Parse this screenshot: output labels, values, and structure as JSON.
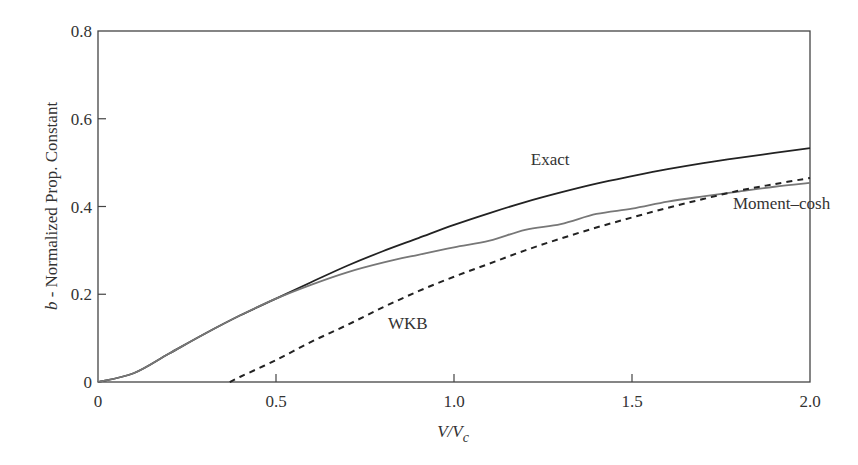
{
  "chart_data": {
    "type": "line",
    "title": "",
    "xlabel": "V/V_c",
    "xlabel_main": "V/V",
    "xlabel_sub": "c",
    "ylabel": "b - Normalized Prop. Constant",
    "ylabel_italic": "b",
    "ylabel_rest": " - Normalized Prop. Constant",
    "xlim": [
      0,
      2.0
    ],
    "ylim": [
      0,
      0.8
    ],
    "xticks": [
      0,
      0.5,
      1.0,
      1.5,
      2.0
    ],
    "xtick_labels": [
      "0",
      "0.5",
      "1.0",
      "1.5",
      "2.0"
    ],
    "yticks": [
      0,
      0.2,
      0.4,
      0.6,
      0.8
    ],
    "ytick_labels": [
      "0",
      "0.2",
      "0.4",
      "0.6",
      "0.8"
    ],
    "grid": false,
    "legend": "none (inline annotations)",
    "series": [
      {
        "name": "Exact",
        "style": "solid",
        "color": "#222222",
        "x": [
          0,
          0.1,
          0.2,
          0.3,
          0.4,
          0.5,
          0.6,
          0.7,
          0.8,
          0.9,
          1.0,
          1.1,
          1.2,
          1.3,
          1.4,
          1.5,
          1.6,
          1.7,
          1.8,
          1.9,
          2.0
        ],
        "y": [
          0,
          0.02,
          0.065,
          0.11,
          0.152,
          0.19,
          0.228,
          0.265,
          0.298,
          0.328,
          0.358,
          0.385,
          0.41,
          0.432,
          0.452,
          0.469,
          0.485,
          0.499,
          0.511,
          0.522,
          0.533
        ]
      },
      {
        "name": "Moment–cosh",
        "style": "solid",
        "color": "#777777",
        "x": [
          0,
          0.1,
          0.2,
          0.3,
          0.4,
          0.5,
          0.6,
          0.7,
          0.8,
          0.9,
          1.0,
          1.1,
          1.2,
          1.3,
          1.4,
          1.5,
          1.6,
          1.7,
          1.8,
          1.9,
          2.0
        ],
        "y": [
          0,
          0.02,
          0.065,
          0.11,
          0.152,
          0.19,
          0.222,
          0.25,
          0.272,
          0.29,
          0.307,
          0.322,
          0.347,
          0.36,
          0.383,
          0.395,
          0.411,
          0.423,
          0.434,
          0.445,
          0.454
        ]
      },
      {
        "name": "WKB",
        "style": "dashed",
        "color": "#222222",
        "x": [
          0.37,
          0.4,
          0.5,
          0.6,
          0.7,
          0.8,
          0.9,
          1.0,
          1.1,
          1.2,
          1.3,
          1.4,
          1.5,
          1.6,
          1.7,
          1.8,
          1.9,
          2.0
        ],
        "y": [
          0,
          0.012,
          0.05,
          0.092,
          0.13,
          0.17,
          0.207,
          0.24,
          0.27,
          0.3,
          0.327,
          0.352,
          0.375,
          0.397,
          0.417,
          0.436,
          0.451,
          0.465
        ]
      }
    ],
    "annotations": [
      {
        "text": "Exact",
        "x": 1.27,
        "y": 0.495
      },
      {
        "text": "Moment–cosh",
        "x": 1.92,
        "y": 0.395
      },
      {
        "text": "WKB",
        "x": 0.87,
        "y": 0.12
      }
    ]
  }
}
